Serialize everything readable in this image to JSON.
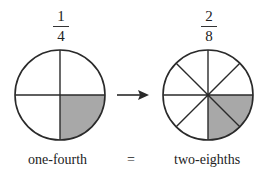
{
  "left": {
    "fraction": {
      "numerator": "1",
      "denominator": "4"
    },
    "label": "one-fourth",
    "parts": 4,
    "shaded_parts": 1
  },
  "right": {
    "fraction": {
      "numerator": "2",
      "denominator": "8"
    },
    "label": "two-eighths",
    "parts": 8,
    "shaded_parts": 2
  },
  "equals": "=",
  "colors": {
    "shade": "#a8a8a8",
    "stroke": "#2a2a2a",
    "background": "#ffffff"
  }
}
